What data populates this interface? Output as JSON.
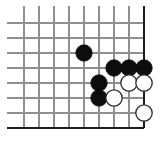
{
  "figure": {
    "board_color": "#ffffff",
    "grid_color": "#8f8f8f",
    "edge_color": "#1c1c1c",
    "black_stone_color": "#0d0d0d",
    "white_stone_color": "#ffffff",
    "white_stone_outline": "#2b2b2b"
  },
  "board": {
    "corner": "bottom-right",
    "grid_spacing": 15,
    "stone_radius": 8.2,
    "columns_x": [
      24,
      39,
      54,
      69,
      84,
      99,
      114,
      129,
      144
    ],
    "rows_y": [
      23,
      38,
      53,
      68,
      83,
      98,
      113,
      128
    ],
    "edges": {
      "right_x": 144,
      "bottom_y": 128,
      "left_x": 24,
      "top_y": 23
    }
  },
  "chart_data": {
    "type": "scatter",
    "xlabel": "",
    "ylabel": "",
    "grid": true,
    "xlim": [
      24,
      144
    ],
    "ylim": [
      23,
      128
    ],
    "series": [
      {
        "name": "black",
        "color": "#0d0d0d",
        "points": [
          {
            "x": 84,
            "y": 53
          },
          {
            "x": 114,
            "y": 68
          },
          {
            "x": 129,
            "y": 68
          },
          {
            "x": 144,
            "y": 68
          },
          {
            "x": 99,
            "y": 83
          },
          {
            "x": 99,
            "y": 98
          }
        ]
      },
      {
        "name": "white",
        "color": "#ffffff",
        "points": [
          {
            "x": 129,
            "y": 83
          },
          {
            "x": 144,
            "y": 83
          },
          {
            "x": 114,
            "y": 98
          },
          {
            "x": 144,
            "y": 113
          }
        ]
      }
    ]
  }
}
